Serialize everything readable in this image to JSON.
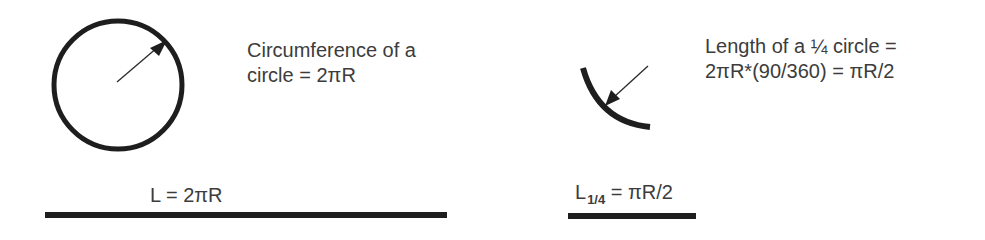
{
  "colors": {
    "stroke": "#1e1e1e",
    "text": "#3c3c3c",
    "background": "#ffffff"
  },
  "left_panel": {
    "circle_label": {
      "line1": "Circumference of a",
      "line2": "circle = 2πR"
    },
    "line_label": "L = 2πR",
    "shape": "full-circle-with-radius-arrow"
  },
  "right_panel": {
    "arc_label": {
      "line1": "Length of a ¼ circle =",
      "line2": "2πR*(90/360) = πR/2"
    },
    "line_label": {
      "main": "L",
      "subscript": "1/4",
      "rest": " = πR/2"
    },
    "shape": "quarter-circle-arc-with-arrow"
  }
}
